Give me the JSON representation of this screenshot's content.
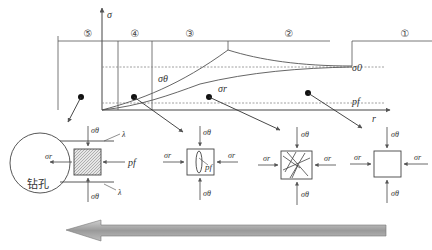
{
  "chart": {
    "y_axis_label": "σ",
    "x_axis_label": "r",
    "zones": [
      "⑤",
      "④",
      "③",
      "②",
      "①"
    ],
    "curve_labels": {
      "theta": "σθ",
      "r": "σr",
      "far_field": "σ0",
      "pore_pressure": "pf"
    }
  },
  "elements": {
    "borehole_label": "钻孔",
    "sigma_theta": "σθ",
    "sigma_r": "σr",
    "pf": "pf",
    "lambda": "λ"
  },
  "colors": {
    "line": "#555555",
    "dashed": "#888888",
    "arrow_fill": "#a6a6a6"
  }
}
